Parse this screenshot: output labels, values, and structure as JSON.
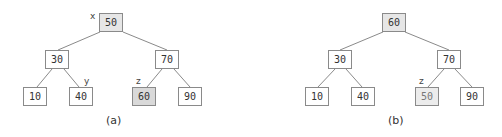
{
  "diagram": {
    "type": "binary-search-tree-deletion",
    "panels": [
      {
        "caption": "(a)",
        "nodes": {
          "root": {
            "value": "50",
            "label": "x"
          },
          "left": {
            "value": "30"
          },
          "right": {
            "value": "70"
          },
          "left_left": {
            "value": "10"
          },
          "left_right": {
            "value": "40",
            "label": "y"
          },
          "right_left": {
            "value": "60",
            "label": "z"
          },
          "right_right": {
            "value": "90"
          }
        }
      },
      {
        "caption": "(b)",
        "nodes": {
          "root": {
            "value": "60"
          },
          "left": {
            "value": "30"
          },
          "right": {
            "value": "70"
          },
          "left_left": {
            "value": "10"
          },
          "left_right": {
            "value": "40"
          },
          "right_left": {
            "value": "50",
            "label": "z"
          },
          "right_right": {
            "value": "90"
          }
        }
      }
    ],
    "colors": {
      "border": "#8a8a8a",
      "edge": "#8a8a8a",
      "root_fill": "#e6e6e6",
      "highlight_fill_a": "#d9d9d9",
      "highlight_fill_b": "#ececec"
    }
  }
}
